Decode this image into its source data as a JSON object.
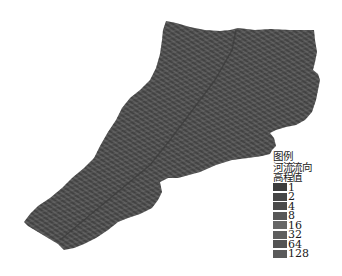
{
  "map": {
    "description": "Shaded DEM-derived flow direction raster of a river basin",
    "fill_color": "#505050",
    "texture_dark": "#3a3a3a",
    "texture_light": "#6e6e6e"
  },
  "legend": {
    "title": "图例",
    "layer_name": "河流流向",
    "field_name": "高程值",
    "items": [
      {
        "label": "1",
        "color": "#3c3c3c"
      },
      {
        "label": "2",
        "color": "#464646"
      },
      {
        "label": "4",
        "color": "#4a4a4a"
      },
      {
        "label": "8",
        "color": "#585858"
      },
      {
        "label": "16",
        "color": "#666666"
      },
      {
        "label": "32",
        "color": "#5e5e5e"
      },
      {
        "label": "64",
        "color": "#545454"
      },
      {
        "label": "128",
        "color": "#5a5a5a"
      }
    ]
  }
}
